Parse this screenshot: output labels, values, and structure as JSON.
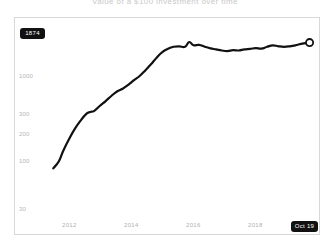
{
  "title": "Value of a $100 investment over time",
  "value_badge": {
    "label": "1874"
  },
  "date_badge": {
    "label": "Oct 19"
  },
  "chart_data": {
    "type": "line",
    "title": "Value of a $100 investment over time",
    "xlabel": "",
    "ylabel": "",
    "yscale": "log",
    "ylim": [
      30,
      2400
    ],
    "xlim": [
      2010.6,
      2019.85
    ],
    "grid": false,
    "legend": null,
    "line_color": "#111111",
    "line_width": 2.2,
    "end_marker": {
      "shape": "circle-open",
      "fill": "#ffffff",
      "stroke": "#111111",
      "x": 2019.8,
      "y": 1874
    },
    "yticks": [
      {
        "value": 1000,
        "label": "1000"
      },
      {
        "value": 300,
        "label": "300"
      },
      {
        "value": 200,
        "label": "200"
      },
      {
        "value": 100,
        "label": "100"
      },
      {
        "value": 30,
        "label": "30"
      }
    ],
    "xticks": [
      {
        "value": 2012,
        "label": "2012"
      },
      {
        "value": 2014,
        "label": "2014"
      },
      {
        "value": 2016,
        "label": "2016"
      },
      {
        "value": 2018,
        "label": "2018"
      }
    ],
    "x": [
      2010.75,
      2010.95,
      2011.1,
      2011.3,
      2011.5,
      2011.7,
      2011.9,
      2012.05,
      2012.2,
      2012.4,
      2012.6,
      2012.8,
      2013.0,
      2013.2,
      2013.4,
      2013.6,
      2013.8,
      2014.0,
      2014.2,
      2014.4,
      2014.6,
      2014.8,
      2015.0,
      2015.2,
      2015.4,
      2015.55,
      2015.7,
      2015.9,
      2016.1,
      2016.3,
      2016.5,
      2016.7,
      2016.9,
      2017.1,
      2017.3,
      2017.5,
      2017.7,
      2017.9,
      2018.1,
      2018.3,
      2018.5,
      2018.7,
      2018.9,
      2019.1,
      2019.3,
      2019.5,
      2019.8
    ],
    "y": [
      100,
      118,
      150,
      196,
      248,
      300,
      352,
      372,
      382,
      430,
      480,
      540,
      600,
      640,
      700,
      780,
      860,
      980,
      1130,
      1320,
      1500,
      1620,
      1700,
      1720,
      1700,
      1900,
      1760,
      1780,
      1700,
      1640,
      1600,
      1560,
      1540,
      1570,
      1560,
      1600,
      1620,
      1650,
      1630,
      1700,
      1760,
      1720,
      1700,
      1720,
      1760,
      1820,
      1874
    ]
  }
}
